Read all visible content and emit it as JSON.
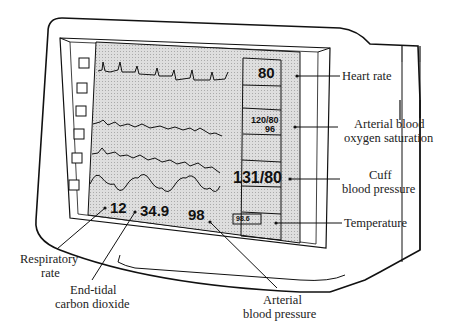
{
  "monitor": {
    "screen_color": "#d8d8d8",
    "left_buttons_count": 6,
    "waveforms": [
      "ECG",
      "arterial pressure wave",
      "oxygen saturation wave",
      "respiratory wave"
    ],
    "right_panel": {
      "heart_rate": "80",
      "arterial_bp": "120/80",
      "oxygen_saturation": "96",
      "cuff_bp": "131/80",
      "temperature": "98.6"
    },
    "bottom_values": {
      "respiratory_rate": "12",
      "etco2": "34.9",
      "arterial_bp_mean": "98"
    }
  },
  "labels": {
    "heart_rate": "Heart rate",
    "oxygen_line1": "Arterial blood",
    "oxygen_line2": "oxygen saturation",
    "cuff_line1": "Cuff",
    "cuff_line2": "blood pressure",
    "temperature": "Temperature",
    "resp_line1": "Respiratory",
    "resp_line2": "rate",
    "etco2_line1": "End-tidal",
    "etco2_line2": "carbon dioxide",
    "abp_line1": "Arterial",
    "abp_line2": "blood pressure"
  }
}
